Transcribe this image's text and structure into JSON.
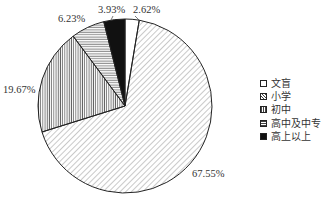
{
  "chart_data": {
    "type": "pie",
    "title": "",
    "categories": [
      "文盲",
      "小学",
      "初中",
      "高中及中专",
      "高上以上"
    ],
    "values": [
      2.62,
      67.55,
      19.67,
      6.23,
      3.93
    ],
    "labels": [
      "2.62%",
      "67.55%",
      "19.67%",
      "6.23%",
      "3.93%"
    ],
    "patterns": [
      "blank",
      "diagonal-hatch",
      "vertical-lines",
      "horizontal-lines",
      "solid-black"
    ],
    "legend_position": "right",
    "start_angle_deg": 0,
    "direction": "clockwise"
  },
  "legend": {
    "items": [
      {
        "label": "文盲"
      },
      {
        "label": "小学"
      },
      {
        "label": "初中"
      },
      {
        "label": "高中及中专"
      },
      {
        "label": "高上以上"
      }
    ]
  }
}
